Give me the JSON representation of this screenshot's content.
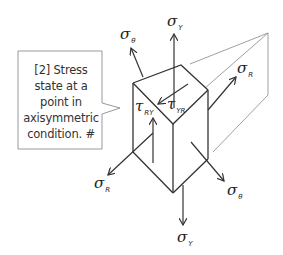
{
  "callout": {
    "lines": [
      "[2] Stress",
      "state at a",
      "point in",
      "axisymmetric",
      "condition. #"
    ]
  },
  "labels": {
    "sigma_y_top": {
      "symbol": "σ",
      "sub": "Y"
    },
    "sigma_theta_top": {
      "symbol": "σ",
      "sub": "θ"
    },
    "sigma_r_right": {
      "symbol": "σ",
      "sub": "R"
    },
    "tau_ry": {
      "symbol": "τ",
      "sub": "RY"
    },
    "tau_yr": {
      "symbol": "τ",
      "sub": "YR"
    },
    "sigma_r_left": {
      "symbol": "σ",
      "sub": "R"
    },
    "sigma_theta_bottom": {
      "symbol": "σ",
      "sub": "θ"
    },
    "sigma_y_bottom": {
      "symbol": "σ",
      "sub": "Y"
    }
  },
  "colors": {
    "line": "#333333",
    "thin_line": "#777777",
    "callout_border": "#999999",
    "text": "#333333"
  }
}
